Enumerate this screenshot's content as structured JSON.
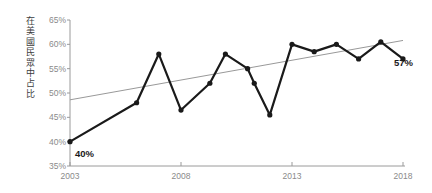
{
  "chart_data": {
    "type": "line",
    "title": "",
    "subtitle": "",
    "xlabel": "",
    "ylabel": "在美國民眾中占比",
    "ylim": [
      35,
      65
    ],
    "xlim": [
      2003,
      2018
    ],
    "ytick_labels": [
      "65%",
      "60%",
      "55%",
      "50%",
      "45%",
      "40%",
      "35%"
    ],
    "ytick_values": [
      65,
      60,
      55,
      50,
      45,
      40,
      35
    ],
    "xtick_labels": [
      "2003",
      "2008",
      "2013",
      "2018"
    ],
    "xtick_values": [
      2003,
      2008,
      2013,
      2018
    ],
    "grid": false,
    "legend": "none",
    "series": [
      {
        "name": "在美國民眾中占比",
        "color": "#1a1a1a",
        "x": [
          2003,
          2006,
          2007,
          2008,
          2009.3,
          2010,
          2011,
          2011.3,
          2012,
          2013,
          2014,
          2015,
          2016,
          2017,
          2018
        ],
        "values": [
          40,
          48,
          58,
          46.5,
          52,
          58,
          55,
          52,
          45.5,
          60,
          58.5,
          60,
          57,
          60.5,
          57
        ]
      },
      {
        "name": "trendline",
        "color": "#999999",
        "x": [
          2003,
          2018
        ],
        "values": [
          48.6,
          60.8
        ]
      }
    ],
    "annotations": [
      {
        "name": "start-value",
        "text": "40%",
        "x": 2003,
        "y": 40
      },
      {
        "name": "end-value",
        "text": "57%",
        "x": 2018,
        "y": 57
      }
    ]
  },
  "axis": {
    "y_label_text": "在美國民眾中占比"
  }
}
